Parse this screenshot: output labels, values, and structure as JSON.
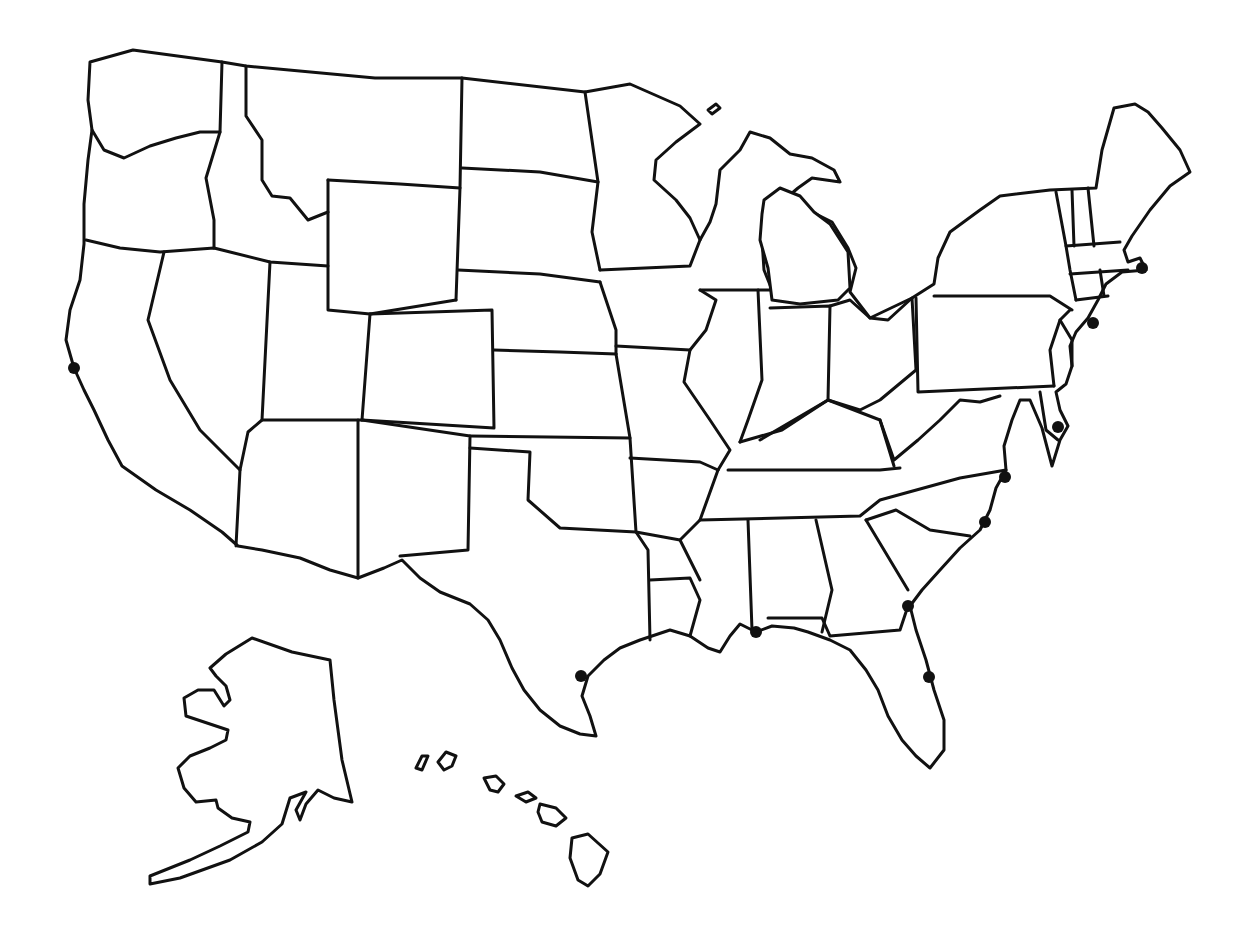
{
  "map": {
    "title": "",
    "type": "blank outline map",
    "region": "United States",
    "style": {
      "background": "#ffffff",
      "stroke": "#111111",
      "marker": "#111111",
      "stroke_width": 3
    },
    "insets": [
      "Alaska",
      "Hawaii"
    ],
    "markers": [
      {
        "id": "san-francisco",
        "x": 74,
        "y": 368
      },
      {
        "id": "houston",
        "x": 581,
        "y": 676
      },
      {
        "id": "mobile",
        "x": 756,
        "y": 632
      },
      {
        "id": "savannah",
        "x": 908,
        "y": 606
      },
      {
        "id": "cape-canaveral",
        "x": 929,
        "y": 677
      },
      {
        "id": "wilmington",
        "x": 985,
        "y": 522
      },
      {
        "id": "norfolk",
        "x": 1005,
        "y": 477
      },
      {
        "id": "delaware-bay",
        "x": 1058,
        "y": 427
      },
      {
        "id": "new-york",
        "x": 1093,
        "y": 323
      },
      {
        "id": "boston",
        "x": 1142,
        "y": 268
      }
    ]
  }
}
